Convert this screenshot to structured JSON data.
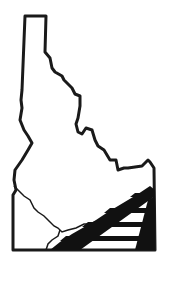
{
  "map": {
    "subject": "Idaho state outline",
    "colors": {
      "outline": "#1a1a1a",
      "fill": "#ffffff",
      "background": "#ffffff",
      "stripes": "#111111"
    },
    "features": [
      "state-border",
      "snake-river",
      "diagonal-stripe-band",
      "horizontal-stripes"
    ]
  }
}
